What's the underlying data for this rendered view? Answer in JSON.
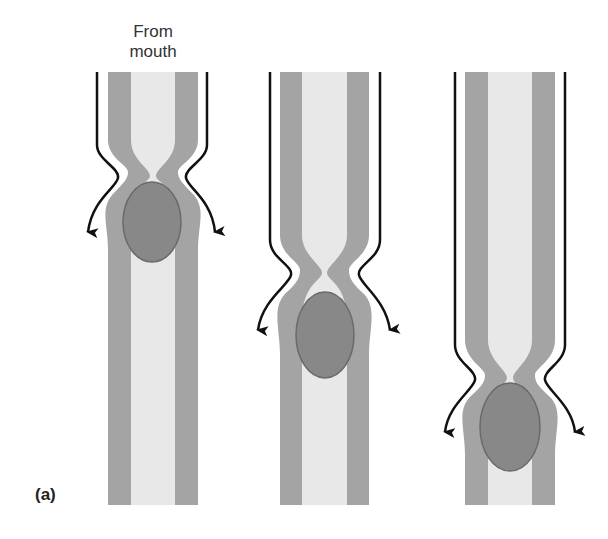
{
  "figure": {
    "panel_label": "(a)",
    "annotation": "From mouth",
    "colors": {
      "wall": "#a4a4a4",
      "lumen": "#e8e8e8",
      "bolus": "#888888",
      "bolus_edge": "#6a6a6a",
      "arrow": "#111111"
    },
    "stages": [
      {
        "name": "stage-1",
        "constriction_y": 175,
        "bolus_cy": 222
      },
      {
        "name": "stage-2",
        "constriction_y": 272,
        "bolus_cy": 335
      },
      {
        "name": "stage-3",
        "constriction_y": 378,
        "bolus_cy": 427
      }
    ]
  }
}
